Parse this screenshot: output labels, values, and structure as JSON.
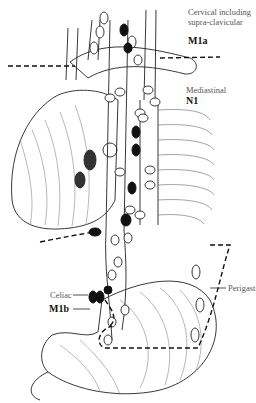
{
  "diagram": {
    "type": "anatomical-illustration",
    "labels": {
      "cervical_line1": "Cervical including",
      "cervical_line2": "supra-clavicular",
      "cervical_code": "M1a",
      "mediastinal": "Mediastinal",
      "mediastinal_code": "N1",
      "perigastric": "Perigastric",
      "celiac": "Celiac",
      "celiac_code": "M1b"
    },
    "colors": {
      "line": "#222222",
      "node_fill_positive": "#111111",
      "node_fill_negative": "#ffffff",
      "background": "#ffffff",
      "label_gray": "#555555"
    }
  }
}
